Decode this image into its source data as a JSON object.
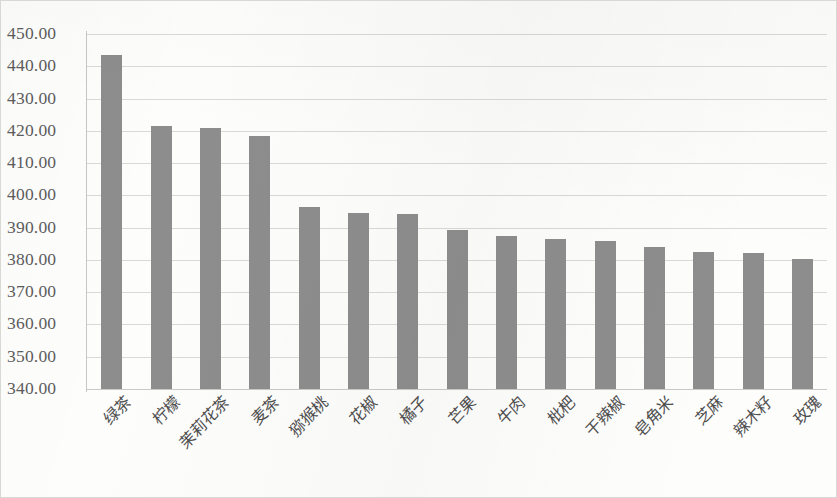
{
  "chart_data": {
    "type": "bar",
    "title": "",
    "subtitle": "",
    "xlabel": "",
    "ylabel": "",
    "ylim": [
      340.0,
      450.0
    ],
    "ytick_step": 10,
    "grid": true,
    "legend": false,
    "legend_position": "none",
    "bar_color": "#8d8d8d",
    "plot_background": "#fdfdfc",
    "gridline_color": "#d9d9d6",
    "ytick_labels": [
      "450.00",
      "440.00",
      "430.00",
      "420.00",
      "410.00",
      "400.00",
      "390.00",
      "380.00",
      "370.00",
      "360.00",
      "350.00",
      "340.00"
    ],
    "ytick_values": [
      450,
      440,
      430,
      420,
      410,
      400,
      390,
      380,
      370,
      360,
      350,
      340
    ],
    "categories": [
      "绿茶",
      "柠檬",
      "茉莉花茶",
      "麦茶",
      "猕猴桃",
      "花椒",
      "橘子",
      "芒果",
      "牛肉",
      "枇杷",
      "干辣椒",
      "皂角米",
      "芝麻",
      "辣木籽",
      "玫瑰"
    ],
    "values": [
      443.5,
      421.5,
      420.8,
      418.3,
      396.5,
      394.4,
      394.1,
      389.2,
      387.4,
      386.4,
      386.0,
      384.0,
      382.4,
      382.1,
      380.4
    ]
  }
}
